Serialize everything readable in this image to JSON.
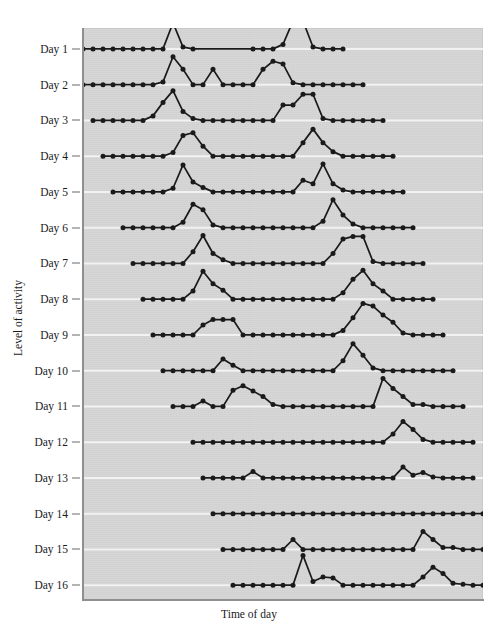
{
  "figure": {
    "title": "",
    "xlabel": "Time of day",
    "ylabel": "Level of activity",
    "background_color": "#d4d4d4",
    "line_color": "#1a1a1a",
    "marker_color": "#1a1a1a",
    "gridline_color": "#f2f2f2"
  },
  "chart_data": {
    "type": "line",
    "title": "",
    "subtitle": "",
    "xlabel": "Time of day",
    "ylabel": "Level of activity",
    "grid": true,
    "grid_axis": "y",
    "legend": false,
    "legend_position": "none",
    "xlim": [
      0,
      40
    ],
    "ylim": [
      0,
      16
    ],
    "x_tick_labels": [],
    "y_tick_labels": [
      "Day 1",
      "Day 2",
      "Day 3",
      "Day 4",
      "Day 5",
      "Day 6",
      "Day 7",
      "Day 8",
      "Day 9",
      "Day 10",
      "Day 11",
      "Day 12",
      "Day 13",
      "Day 14",
      "Day 15",
      "Day 16"
    ],
    "series": [
      {
        "name": "Day 1",
        "baseline_index": 0,
        "x": [
          0,
          1,
          2,
          3,
          4,
          5,
          6,
          7,
          8,
          9,
          10,
          11,
          17,
          18,
          19,
          20,
          21,
          22,
          23,
          24,
          25,
          26
        ],
        "values": [
          0,
          0,
          0,
          0,
          0,
          0,
          0,
          0,
          0,
          1.45,
          0.1,
          0,
          0,
          0,
          0,
          0.25,
          1.55,
          1.55,
          0.1,
          0,
          0,
          0
        ]
      },
      {
        "name": "Day 2",
        "baseline_index": 1,
        "x": [
          0,
          1,
          2,
          3,
          4,
          5,
          6,
          7,
          8,
          9,
          10,
          11,
          12,
          13,
          14,
          15,
          16,
          17,
          18,
          19,
          20,
          21,
          22,
          23,
          24,
          25,
          26,
          27,
          28
        ],
        "values": [
          0,
          0,
          0,
          0,
          0,
          0,
          0,
          0,
          0.15,
          1.55,
          0.85,
          0,
          0,
          0.85,
          0,
          0,
          0,
          0,
          0.85,
          1.3,
          1.15,
          0.1,
          0,
          0,
          0,
          0,
          0,
          0,
          0
        ]
      },
      {
        "name": "Day 3",
        "baseline_index": 2,
        "x": [
          1,
          2,
          3,
          4,
          5,
          6,
          7,
          8,
          9,
          10,
          11,
          12,
          13,
          14,
          15,
          16,
          17,
          18,
          19,
          20,
          21,
          22,
          23,
          24,
          25,
          26,
          27,
          28,
          29,
          30
        ],
        "values": [
          0,
          0,
          0,
          0,
          0,
          0,
          0.25,
          1.0,
          1.65,
          0.5,
          0.1,
          0,
          0,
          0,
          0,
          0,
          0,
          0,
          0,
          0.85,
          0.85,
          1.45,
          1.45,
          0.1,
          0,
          0,
          0,
          0,
          0,
          0
        ]
      },
      {
        "name": "Day 4",
        "baseline_index": 3,
        "x": [
          2,
          3,
          4,
          5,
          6,
          7,
          8,
          9,
          10,
          11,
          12,
          13,
          14,
          15,
          16,
          17,
          18,
          19,
          20,
          21,
          22,
          23,
          24,
          25,
          26,
          27,
          28,
          29,
          30,
          31
        ],
        "values": [
          0,
          0,
          0,
          0,
          0,
          0,
          0,
          0.2,
          1.15,
          1.3,
          0.55,
          0,
          0,
          0,
          0,
          0,
          0,
          0,
          0,
          0,
          0.75,
          1.5,
          0.75,
          0.25,
          0,
          0,
          0,
          0,
          0,
          0
        ]
      },
      {
        "name": "Day 5",
        "baseline_index": 4,
        "x": [
          3,
          4,
          5,
          6,
          7,
          8,
          9,
          10,
          11,
          12,
          13,
          14,
          15,
          16,
          17,
          18,
          19,
          20,
          21,
          22,
          23,
          24,
          25,
          26,
          27,
          28,
          29,
          30,
          31,
          32
        ],
        "values": [
          0,
          0,
          0,
          0,
          0,
          0,
          0.2,
          1.5,
          0.55,
          0.25,
          0,
          0,
          0,
          0,
          0,
          0,
          0,
          0,
          0,
          0.65,
          0.45,
          1.55,
          0.45,
          0.1,
          0,
          0,
          0,
          0,
          0,
          0
        ]
      },
      {
        "name": "Day 6",
        "baseline_index": 5,
        "x": [
          4,
          5,
          6,
          7,
          8,
          9,
          10,
          11,
          12,
          13,
          14,
          15,
          16,
          17,
          18,
          19,
          20,
          21,
          22,
          23,
          24,
          25,
          26,
          27,
          28,
          29,
          30,
          31,
          32,
          33
        ],
        "values": [
          0,
          0,
          0,
          0,
          0,
          0,
          0.3,
          1.3,
          1.0,
          0.15,
          0,
          0,
          0,
          0,
          0,
          0,
          0,
          0,
          0,
          0,
          0.35,
          1.55,
          0.7,
          0.2,
          0,
          0,
          0,
          0,
          0,
          0
        ]
      },
      {
        "name": "Day 7",
        "baseline_index": 6,
        "x": [
          5,
          6,
          7,
          8,
          9,
          10,
          11,
          12,
          13,
          14,
          15,
          16,
          17,
          18,
          19,
          20,
          21,
          22,
          23,
          24,
          25,
          26,
          27,
          28,
          29,
          30,
          31,
          32,
          33,
          34
        ],
        "values": [
          0,
          0,
          0,
          0,
          0,
          0,
          0.65,
          1.55,
          0.55,
          0.2,
          0,
          0,
          0,
          0,
          0,
          0,
          0,
          0,
          0,
          0,
          0.55,
          1.35,
          1.5,
          1.5,
          0.1,
          0,
          0,
          0,
          0,
          0
        ]
      },
      {
        "name": "Day 8",
        "baseline_index": 7,
        "x": [
          6,
          7,
          8,
          9,
          10,
          11,
          12,
          13,
          14,
          15,
          16,
          17,
          18,
          19,
          20,
          21,
          22,
          23,
          24,
          25,
          26,
          27,
          28,
          29,
          30,
          31,
          32,
          33,
          34,
          35
        ],
        "values": [
          0,
          0,
          0,
          0,
          0,
          0.45,
          1.55,
          0.85,
          0.5,
          0,
          0,
          0,
          0,
          0,
          0,
          0,
          0,
          0,
          0,
          0,
          0.35,
          1.1,
          1.6,
          0.85,
          0.45,
          0,
          0,
          0,
          0,
          0
        ]
      },
      {
        "name": "Day 9",
        "baseline_index": 8,
        "x": [
          7,
          8,
          9,
          10,
          11,
          12,
          13,
          14,
          15,
          16,
          17,
          18,
          19,
          20,
          21,
          22,
          23,
          24,
          25,
          26,
          27,
          28,
          29,
          30,
          31,
          32,
          33,
          34,
          35,
          36
        ],
        "values": [
          0,
          0,
          0,
          0,
          0,
          0.55,
          0.85,
          0.85,
          0.85,
          0,
          0,
          0,
          0,
          0,
          0,
          0,
          0,
          0,
          0,
          0.25,
          0.95,
          1.75,
          1.6,
          1.1,
          0.7,
          0.1,
          0,
          0,
          0,
          0
        ]
      },
      {
        "name": "Day 10",
        "baseline_index": 9,
        "x": [
          8,
          9,
          10,
          11,
          12,
          13,
          14,
          15,
          16,
          17,
          18,
          19,
          20,
          21,
          22,
          23,
          24,
          25,
          26,
          27,
          28,
          29,
          30,
          31,
          32,
          33,
          34,
          35,
          36,
          37
        ],
        "values": [
          0,
          0,
          0,
          0,
          0,
          0,
          0.65,
          0.3,
          0,
          0,
          0,
          0,
          0,
          0,
          0,
          0,
          0,
          0,
          0.55,
          1.5,
          0.85,
          0.15,
          0,
          0,
          0,
          0,
          0,
          0,
          0,
          0
        ]
      },
      {
        "name": "Day 11",
        "baseline_index": 10,
        "x": [
          9,
          10,
          11,
          12,
          13,
          14,
          15,
          16,
          17,
          18,
          19,
          20,
          21,
          22,
          23,
          24,
          25,
          26,
          27,
          28,
          29,
          30,
          31,
          32,
          33,
          34,
          35,
          36,
          37,
          38
        ],
        "values": [
          0,
          0,
          0,
          0.3,
          0,
          0,
          0.9,
          1.15,
          0.85,
          0.55,
          0.1,
          0,
          0,
          0,
          0,
          0,
          0,
          0,
          0,
          0,
          0,
          1.55,
          1.0,
          0.55,
          0.1,
          0.1,
          0,
          0,
          0,
          0
        ]
      },
      {
        "name": "Day 12",
        "baseline_index": 11,
        "x": [
          11,
          12,
          13,
          14,
          15,
          16,
          17,
          18,
          19,
          20,
          21,
          22,
          23,
          24,
          25,
          26,
          27,
          28,
          29,
          30,
          31,
          32,
          33,
          34,
          35,
          36,
          37,
          38,
          39
        ],
        "values": [
          0,
          0,
          0,
          0,
          0,
          0,
          0,
          0,
          0,
          0,
          0,
          0,
          0,
          0,
          0,
          0,
          0,
          0,
          0,
          0,
          0.45,
          1.15,
          0.7,
          0.15,
          0,
          0,
          0,
          0,
          0
        ]
      },
      {
        "name": "Day 13",
        "baseline_index": 12,
        "x": [
          12,
          13,
          14,
          15,
          16,
          17,
          18,
          19,
          20,
          21,
          22,
          23,
          24,
          25,
          26,
          27,
          28,
          29,
          30,
          31,
          32,
          33,
          34,
          35,
          36,
          37,
          38,
          39
        ],
        "values": [
          0,
          0,
          0,
          0,
          0,
          0.35,
          0,
          0,
          0,
          0,
          0,
          0,
          0,
          0,
          0,
          0,
          0,
          0,
          0,
          0,
          0.6,
          0.15,
          0.3,
          0.05,
          0,
          0,
          0,
          0
        ]
      },
      {
        "name": "Day 14",
        "baseline_index": 13,
        "x": [
          13,
          14,
          15,
          16,
          17,
          18,
          19,
          20,
          21,
          22,
          23,
          24,
          25,
          26,
          27,
          28,
          29,
          30,
          31,
          32,
          33,
          34,
          35,
          36,
          37,
          38,
          39,
          40
        ],
        "values": [
          0,
          0,
          0,
          0,
          0,
          0,
          0,
          0,
          0,
          0,
          0,
          0,
          0,
          0,
          0,
          0,
          0,
          0,
          0,
          0,
          0,
          0,
          0,
          0,
          0,
          0,
          0,
          0
        ]
      },
      {
        "name": "Day 15",
        "baseline_index": 14,
        "x": [
          14,
          15,
          16,
          17,
          18,
          19,
          20,
          21,
          22,
          23,
          24,
          25,
          26,
          27,
          28,
          29,
          30,
          31,
          32,
          33,
          34,
          35,
          36,
          37,
          38,
          39,
          40
        ],
        "values": [
          0,
          0,
          0,
          0,
          0,
          0,
          0,
          0.55,
          0,
          0,
          0,
          0,
          0,
          0,
          0,
          0,
          0,
          0,
          0,
          0,
          1.0,
          0.55,
          0.1,
          0.1,
          0,
          0,
          0
        ]
      },
      {
        "name": "Day 16",
        "baseline_index": 15,
        "x": [
          15,
          16,
          17,
          18,
          19,
          20,
          21,
          22,
          23,
          24,
          25,
          26,
          27,
          28,
          29,
          30,
          31,
          32,
          33,
          34,
          35,
          36,
          37,
          38,
          39,
          40
        ],
        "values": [
          0,
          0,
          0,
          0,
          0,
          0,
          0,
          1.65,
          0.2,
          0.45,
          0.4,
          0,
          0,
          0,
          0,
          0,
          0,
          0,
          0,
          0.45,
          1.0,
          0.65,
          0.1,
          0.05,
          0,
          0
        ]
      }
    ]
  }
}
